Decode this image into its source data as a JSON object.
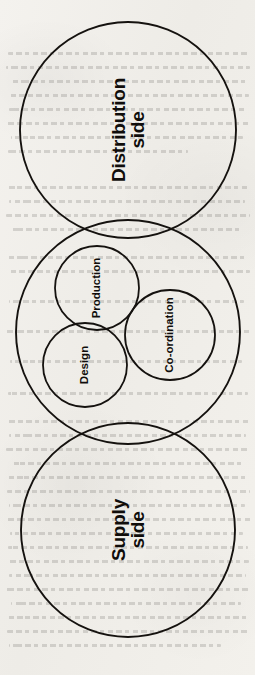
{
  "figure": {
    "orientation": "rotated-90-ccw",
    "background_color": "#f2f0ec",
    "stroke_color": "#15120f",
    "label_color": "#100d0b"
  },
  "chart_data": {
    "type": "venn",
    "xlabel": "",
    "ylabel": "",
    "grid": false,
    "legend": "none",
    "view_box": [
      0,
      0,
      255,
      675
    ],
    "sets": [
      {
        "name": "Distribution side",
        "label": "Distribution\nside",
        "role": "major",
        "cx": 128,
        "cy": 130,
        "r": 108,
        "stroke_width": 1.9,
        "label_x": 128,
        "label_y": 130,
        "label_rotation": -90,
        "font_size": 19
      },
      {
        "name": "Middle ring",
        "label": "",
        "role": "container",
        "cx": 128,
        "cy": 332,
        "r": 112,
        "stroke_width": 1.9,
        "label_x": 128,
        "label_y": 332,
        "label_rotation": -90,
        "font_size": 0
      },
      {
        "name": "Supply side",
        "label": "Supply\nside",
        "role": "major",
        "cx": 128,
        "cy": 530,
        "r": 107,
        "stroke_width": 1.9,
        "label_x": 128,
        "label_y": 530,
        "label_rotation": -90,
        "font_size": 19
      },
      {
        "name": "Production",
        "label": "Production",
        "role": "minor",
        "cx": 97,
        "cy": 288,
        "r": 42,
        "stroke_width": 1.8,
        "label_x": 97,
        "label_y": 288,
        "label_rotation": -90,
        "font_size": 11.5
      },
      {
        "name": "Design",
        "label": "Design",
        "role": "minor",
        "cx": 85,
        "cy": 365,
        "r": 42,
        "stroke_width": 1.8,
        "label_x": 85,
        "label_y": 365,
        "label_rotation": -90,
        "font_size": 11.5
      },
      {
        "name": "Co-ordination",
        "label": "Co-ordination",
        "role": "minor",
        "cx": 170,
        "cy": 335,
        "r": 45,
        "stroke_width": 1.8,
        "label_x": 170,
        "label_y": 335,
        "label_rotation": -90,
        "font_size": 11.5
      }
    ],
    "labels": [
      "Distribution side",
      "Supply side",
      "Production",
      "Design",
      "Co-ordination"
    ],
    "annotations": []
  },
  "ghost_text_lines": [
    {
      "x": 8,
      "y": 52,
      "w": 240
    },
    {
      "x": 6,
      "y": 66,
      "w": 244
    },
    {
      "x": 10,
      "y": 80,
      "w": 236
    },
    {
      "x": 7,
      "y": 94,
      "w": 242
    },
    {
      "x": 9,
      "y": 108,
      "w": 238
    },
    {
      "x": 6,
      "y": 122,
      "w": 243
    },
    {
      "x": 11,
      "y": 136,
      "w": 232
    },
    {
      "x": 8,
      "y": 150,
      "w": 180
    },
    {
      "x": 7,
      "y": 186,
      "w": 241
    },
    {
      "x": 9,
      "y": 200,
      "w": 236
    },
    {
      "x": 6,
      "y": 214,
      "w": 244
    },
    {
      "x": 10,
      "y": 228,
      "w": 230
    },
    {
      "x": 8,
      "y": 256,
      "w": 239
    },
    {
      "x": 7,
      "y": 270,
      "w": 243
    },
    {
      "x": 9,
      "y": 300,
      "w": 235
    },
    {
      "x": 6,
      "y": 330,
      "w": 245
    },
    {
      "x": 10,
      "y": 360,
      "w": 232
    },
    {
      "x": 8,
      "y": 392,
      "w": 240
    },
    {
      "x": 7,
      "y": 420,
      "w": 242
    },
    {
      "x": 9,
      "y": 434,
      "w": 237
    },
    {
      "x": 6,
      "y": 448,
      "w": 244
    },
    {
      "x": 11,
      "y": 462,
      "w": 231
    },
    {
      "x": 8,
      "y": 476,
      "w": 240
    },
    {
      "x": 7,
      "y": 490,
      "w": 243
    },
    {
      "x": 9,
      "y": 504,
      "w": 236
    },
    {
      "x": 6,
      "y": 518,
      "w": 245
    },
    {
      "x": 10,
      "y": 532,
      "w": 233
    },
    {
      "x": 8,
      "y": 546,
      "w": 240
    },
    {
      "x": 7,
      "y": 560,
      "w": 242
    },
    {
      "x": 9,
      "y": 574,
      "w": 237
    },
    {
      "x": 6,
      "y": 588,
      "w": 244
    },
    {
      "x": 11,
      "y": 602,
      "w": 230
    },
    {
      "x": 8,
      "y": 616,
      "w": 241
    },
    {
      "x": 7,
      "y": 630,
      "w": 243
    },
    {
      "x": 9,
      "y": 644,
      "w": 212
    }
  ]
}
